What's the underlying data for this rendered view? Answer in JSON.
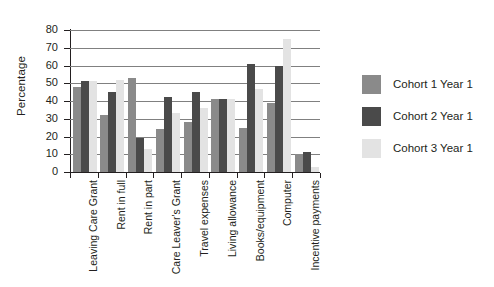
{
  "chart_data": {
    "type": "bar",
    "title": "",
    "xlabel": "",
    "ylabel": "Percentage",
    "ylim": [
      0,
      80
    ],
    "yticks": [
      0,
      10,
      20,
      30,
      40,
      50,
      60,
      70,
      80
    ],
    "grid": true,
    "legend_position": "right",
    "categories": [
      "Leaving Care Grant",
      "Rent in full",
      "Rent in part",
      "Care Leaver's Grant",
      "Travel expenses",
      "Living allowance",
      "Books/equipment",
      "Computer",
      "Incentive payments"
    ],
    "series": [
      {
        "name": "Cohort 1 Year 1",
        "color": "#8a8a8a",
        "values": [
          48,
          32,
          53,
          24,
          28,
          41,
          25,
          39,
          10
        ]
      },
      {
        "name": "Cohort 2 Year 1",
        "color": "#4a4a4a",
        "values": [
          51,
          45,
          19,
          42,
          45,
          41,
          61,
          60,
          11
        ]
      },
      {
        "name": "Cohort 3 Year 1",
        "color": "#e3e3e3",
        "values": [
          51,
          52,
          13,
          33,
          36,
          41,
          47,
          75,
          3
        ]
      }
    ]
  }
}
